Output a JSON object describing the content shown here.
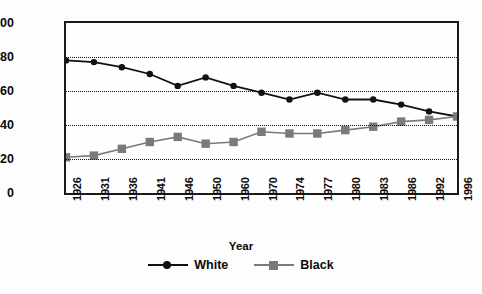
{
  "chart_data": {
    "type": "line",
    "title": "",
    "xlabel": "Year",
    "ylabel": "Percentage of All Admissions",
    "categories": [
      "1926",
      "1931",
      "1936",
      "1941",
      "1946",
      "1950",
      "1960",
      "1970",
      "1974",
      "1977",
      "1980",
      "1983",
      "1986",
      "1992",
      "1996"
    ],
    "ylim": [
      0,
      100
    ],
    "yticks": [
      0,
      20,
      40,
      60,
      80,
      100
    ],
    "grid": true,
    "gridlines_at": [
      20,
      40,
      60,
      80
    ],
    "legend_position": "bottom-center",
    "series": [
      {
        "name": "White",
        "color": "#111111",
        "marker": "circle",
        "values": [
          78,
          77,
          74,
          70,
          63,
          68,
          63,
          59,
          55,
          59,
          55,
          55,
          52,
          48,
          45
        ]
      },
      {
        "name": "Black",
        "color": "#7a7a7a",
        "marker": "square",
        "values": [
          21,
          22,
          26,
          30,
          33,
          29,
          30,
          36,
          35,
          35,
          37,
          39,
          42,
          43,
          45
        ]
      }
    ]
  },
  "axis": {
    "y_title": "Percentage of All Admissions",
    "x_title": "Year"
  },
  "colors": {
    "frame": "#1a1a1a",
    "grid": "#111111",
    "white_series": "#111111",
    "black_series": "#7a7a7a",
    "background": "#fefefe"
  }
}
